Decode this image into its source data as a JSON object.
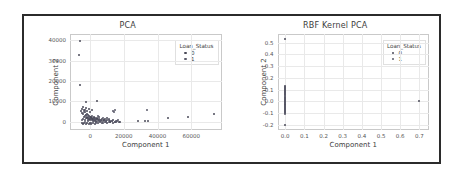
{
  "figure": {
    "background": "#ffffff",
    "frame_color": "#2b2b2b",
    "grid_color": "#e9e9e9",
    "marker_color_0": "#4a4a58",
    "marker_color_1": "#5a5a6a"
  },
  "chart_data": [
    {
      "type": "scatter",
      "title": "PCA",
      "xlabel": "Component 1",
      "ylabel": "Component 2",
      "xlim": [
        -12000,
        78000
      ],
      "ylim": [
        -4000,
        43000
      ],
      "xticks": [
        "0",
        "20000",
        "40000",
        "60000"
      ],
      "xtick_values": [
        0,
        20000,
        40000,
        60000
      ],
      "yticks": [
        "0",
        "10000",
        "20000",
        "30000",
        "40000"
      ],
      "ytick_values": [
        0,
        10000,
        20000,
        30000,
        40000
      ],
      "grid": true,
      "legend": {
        "title": "Loan_Status",
        "position": "upper right",
        "entries": [
          {
            "label": "0",
            "color": "#4a4a58"
          },
          {
            "label": "1",
            "color": "#5a5a6a"
          }
        ]
      },
      "series": [
        {
          "name": "0",
          "color": "#4a4a58",
          "points": [
            [
              -6200,
              39800
            ],
            [
              -6500,
              32500
            ],
            [
              -5800,
              18000
            ],
            [
              -2300,
              9700
            ],
            [
              3900,
              10000
            ],
            [
              -5200,
              5200
            ],
            [
              -4600,
              4300
            ],
            [
              -4100,
              3600
            ],
            [
              -3700,
              5800
            ],
            [
              -3300,
              2900
            ],
            [
              -3000,
              4700
            ],
            [
              -2700,
              3300
            ],
            [
              -2400,
              2100
            ],
            [
              -2100,
              4000
            ],
            [
              -1800,
              2600
            ],
            [
              -1500,
              3500
            ],
            [
              -1200,
              1800
            ],
            [
              -900,
              2900
            ],
            [
              -600,
              1300
            ],
            [
              -300,
              2200
            ],
            [
              0,
              900
            ],
            [
              300,
              1700
            ],
            [
              600,
              2600
            ],
            [
              900,
              1100
            ],
            [
              1200,
              2000
            ],
            [
              1500,
              700
            ],
            [
              1800,
              1500
            ],
            [
              2100,
              2300
            ],
            [
              2400,
              600
            ],
            [
              2700,
              1300
            ],
            [
              3000,
              1900
            ],
            [
              3400,
              500
            ],
            [
              3800,
              1200
            ],
            [
              4200,
              1800
            ],
            [
              4600,
              400
            ],
            [
              5000,
              1000
            ],
            [
              5400,
              1600
            ],
            [
              5900,
              300
            ],
            [
              6400,
              900
            ],
            [
              6900,
              1400
            ],
            [
              7500,
              250
            ],
            [
              8100,
              800
            ],
            [
              8800,
              1200
            ],
            [
              9500,
              200
            ],
            [
              10200,
              700
            ],
            [
              11000,
              1000
            ],
            [
              11900,
              150
            ],
            [
              12800,
              550
            ],
            [
              13800,
              850
            ],
            [
              14900,
              100
            ],
            [
              16000,
              450
            ],
            [
              17200,
              100
            ],
            [
              -5000,
              -500
            ],
            [
              -4200,
              -900
            ],
            [
              -3400,
              -400
            ],
            [
              -2600,
              -1100
            ],
            [
              -1800,
              -600
            ],
            [
              -1000,
              -1300
            ],
            [
              -200,
              -500
            ],
            [
              700,
              -1000
            ],
            [
              1600,
              -400
            ],
            [
              2600,
              -900
            ],
            [
              3600,
              -300
            ],
            [
              4700,
              -700
            ],
            [
              5900,
              -250
            ],
            [
              7200,
              -600
            ],
            [
              8600,
              -200
            ],
            [
              10100,
              -450
            ],
            [
              11800,
              -150
            ],
            [
              13600,
              -350
            ],
            [
              15600,
              -120
            ],
            [
              17800,
              -250
            ],
            [
              -4800,
              6400
            ],
            [
              -4000,
              7100
            ],
            [
              -3200,
              6000
            ],
            [
              -2500,
              6800
            ],
            [
              -1700,
              5500
            ],
            [
              -900,
              6200
            ],
            [
              -100,
              5000
            ],
            [
              800,
              5700
            ],
            [
              -4400,
              1500
            ],
            [
              -3600,
              2400
            ],
            [
              -2800,
              1100
            ],
            [
              -2000,
              2000
            ],
            [
              -1200,
              900
            ],
            [
              -400,
              1600
            ],
            [
              400,
              2500
            ],
            [
              1300,
              1200
            ],
            [
              2200,
              2100
            ],
            [
              3100,
              800
            ],
            [
              4100,
              1500
            ],
            [
              5200,
              2200
            ],
            [
              6500,
              600
            ],
            [
              8000,
              1100
            ],
            [
              9800,
              1700
            ],
            [
              12000,
              400
            ],
            [
              28500,
              600
            ],
            [
              32500,
              400
            ],
            [
              34500,
              500
            ],
            [
              46500,
              1900
            ],
            [
              58000,
              2600
            ],
            [
              73500,
              4000
            ]
          ]
        },
        {
          "name": "1",
          "color": "#5a5a6a",
          "points": [
            [
              13500,
              5100
            ],
            [
              14200,
              4600
            ],
            [
              14800,
              6000
            ],
            [
              33500,
              5900
            ],
            [
              -3900,
              4900
            ],
            [
              -2200,
              3100
            ],
            [
              -700,
              2400
            ],
            [
              1100,
              3000
            ],
            [
              2900,
              1400
            ],
            [
              4400,
              2700
            ],
            [
              6100,
              1000
            ],
            [
              7800,
              2100
            ],
            [
              9600,
              500
            ],
            [
              11200,
              1300
            ],
            [
              15200,
              300
            ],
            [
              16800,
              700
            ],
            [
              -4700,
              800
            ],
            [
              -3100,
              -200
            ],
            [
              -1400,
              400
            ],
            [
              200,
              -700
            ],
            [
              1900,
              200
            ],
            [
              3700,
              -500
            ],
            [
              5600,
              300
            ],
            [
              7400,
              -400
            ],
            [
              9200,
              150
            ],
            [
              11000,
              -300
            ],
            [
              13000,
              200
            ],
            [
              15000,
              -150
            ]
          ]
        }
      ]
    },
    {
      "type": "scatter",
      "title": "RBF Kernel PCA",
      "xlabel": "Component 1",
      "ylabel": "Component 2",
      "xlim": [
        -0.04,
        0.75
      ],
      "ylim": [
        -0.245,
        0.575
      ],
      "xticks": [
        "0.0",
        "0.1",
        "0.2",
        "0.3",
        "0.4",
        "0.5",
        "0.6",
        "0.7"
      ],
      "xtick_values": [
        0.0,
        0.1,
        0.2,
        0.3,
        0.4,
        0.5,
        0.6,
        0.7
      ],
      "yticks": [
        "-0.2",
        "-0.1",
        "0.0",
        "0.1",
        "0.2",
        "0.3",
        "0.4",
        "0.5"
      ],
      "ytick_values": [
        -0.2,
        -0.1,
        0.0,
        0.1,
        0.2,
        0.3,
        0.4,
        0.5
      ],
      "grid": true,
      "legend": {
        "title": "Loan_Status",
        "position": "upper right",
        "entries": [
          {
            "label": "0",
            "color": "#4a4a58"
          },
          {
            "label": "1",
            "color": "#5a5a6a"
          }
        ]
      },
      "series": [
        {
          "name": "0",
          "color": "#4a4a58",
          "points": [
            [
              0.0,
              0.53
            ],
            [
              0.0,
              0.131
            ],
            [
              0.0,
              0.122
            ],
            [
              0.0,
              0.113
            ],
            [
              0.0,
              0.104
            ],
            [
              0.0,
              0.095
            ],
            [
              0.0,
              0.086
            ],
            [
              0.0,
              0.077
            ],
            [
              0.0,
              0.068
            ],
            [
              0.0,
              0.059
            ],
            [
              0.0,
              0.05
            ],
            [
              0.0,
              0.041
            ],
            [
              0.0,
              0.032
            ],
            [
              0.0,
              0.023
            ],
            [
              0.0,
              0.014
            ],
            [
              0.0,
              0.005
            ],
            [
              0.0,
              -0.004
            ],
            [
              0.0,
              -0.013
            ],
            [
              0.0,
              -0.022
            ],
            [
              0.0,
              -0.031
            ],
            [
              0.0,
              -0.04
            ],
            [
              0.0,
              -0.049
            ],
            [
              0.0,
              -0.058
            ],
            [
              0.0,
              -0.067
            ],
            [
              0.0,
              -0.076
            ],
            [
              0.0,
              -0.085
            ],
            [
              0.0,
              -0.094
            ],
            [
              0.0,
              -0.103
            ],
            [
              0.0,
              -0.2
            ],
            [
              0.7,
              0.0
            ]
          ]
        },
        {
          "name": "1",
          "color": "#5a5a6a",
          "points": [
            [
              0.0,
              0.126
            ],
            [
              0.0,
              0.108
            ],
            [
              0.0,
              0.09
            ],
            [
              0.0,
              0.072
            ],
            [
              0.0,
              0.054
            ],
            [
              0.0,
              0.036
            ],
            [
              0.0,
              0.018
            ],
            [
              0.0,
              0.0
            ],
            [
              0.0,
              -0.018
            ],
            [
              0.0,
              -0.036
            ],
            [
              0.0,
              -0.054
            ],
            [
              0.0,
              -0.072
            ],
            [
              0.0,
              -0.09
            ],
            [
              0.0,
              -0.108
            ]
          ]
        }
      ]
    }
  ]
}
